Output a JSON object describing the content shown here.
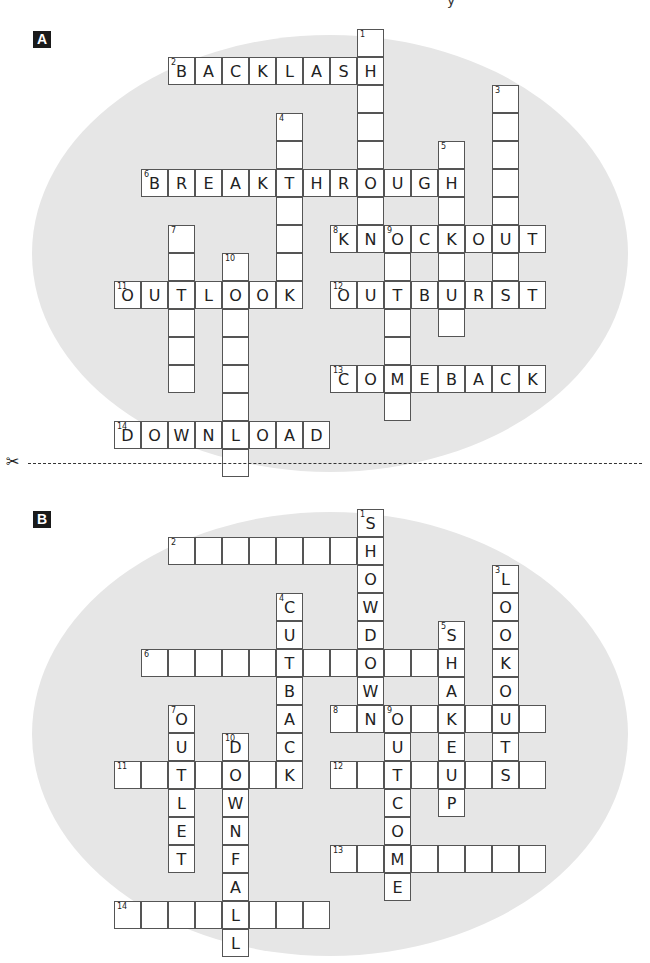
{
  "page": {
    "top_fragment": "y",
    "scissors_icon": "✂",
    "cell_size": {
      "w": 27,
      "h": 28
    },
    "origin_x": 114,
    "colors": {
      "ellipse": "#e6e6e6",
      "cell_border": "#555555",
      "label_bg": "#1a1a1a"
    }
  },
  "puzzles": [
    {
      "id": "A",
      "label": "A",
      "label_pos": {
        "x": 33,
        "y": 31
      },
      "origin_y": 29,
      "ellipse": {
        "left": 32,
        "top": 35,
        "width": 596,
        "height": 437
      },
      "words": [
        {
          "num": "1",
          "dir": "down",
          "row": 0,
          "col": 9,
          "len": 8,
          "answer": ""
        },
        {
          "num": "2",
          "dir": "across",
          "row": 1,
          "col": 2,
          "len": 8,
          "answer": "BACKLASH"
        },
        {
          "num": "3",
          "dir": "down",
          "row": 2,
          "col": 14,
          "len": 8,
          "answer": ""
        },
        {
          "num": "4",
          "dir": "down",
          "row": 3,
          "col": 6,
          "len": 7,
          "answer": ""
        },
        {
          "num": "5",
          "dir": "down",
          "row": 4,
          "col": 12,
          "len": 7,
          "answer": ""
        },
        {
          "num": "6",
          "dir": "across",
          "row": 5,
          "col": 1,
          "len": 12,
          "answer": "BREAKTHROUGH"
        },
        {
          "num": "7",
          "dir": "down",
          "row": 7,
          "col": 2,
          "len": 6,
          "answer": ""
        },
        {
          "num": "8",
          "dir": "across",
          "row": 7,
          "col": 8,
          "len": 8,
          "answer": "KNOCKOUT"
        },
        {
          "num": "9",
          "dir": "down",
          "row": 7,
          "col": 10,
          "len": 7,
          "answer": ""
        },
        {
          "num": "10",
          "dir": "down",
          "row": 8,
          "col": 4,
          "len": 8,
          "answer": ""
        },
        {
          "num": "11",
          "dir": "across",
          "row": 9,
          "col": 0,
          "len": 7,
          "answer": "OUTLOOK"
        },
        {
          "num": "12",
          "dir": "across",
          "row": 9,
          "col": 8,
          "len": 8,
          "answer": "OUTBURST"
        },
        {
          "num": "13",
          "dir": "across",
          "row": 12,
          "col": 8,
          "len": 8,
          "answer": "COMEBACK"
        },
        {
          "num": "14",
          "dir": "across",
          "row": 14,
          "col": 0,
          "len": 8,
          "answer": "DOWNLOAD"
        }
      ]
    },
    {
      "id": "B",
      "label": "B",
      "label_pos": {
        "x": 33,
        "y": 511
      },
      "origin_y": 509,
      "ellipse": {
        "left": 32,
        "top": 512,
        "width": 596,
        "height": 444
      },
      "words": [
        {
          "num": "1",
          "dir": "down",
          "row": 0,
          "col": 9,
          "len": 8,
          "answer": "SHOWDOWN"
        },
        {
          "num": "2",
          "dir": "across",
          "row": 1,
          "col": 2,
          "len": 8,
          "answer": ""
        },
        {
          "num": "3",
          "dir": "down",
          "row": 2,
          "col": 14,
          "len": 8,
          "answer": "LOOKOUTS"
        },
        {
          "num": "4",
          "dir": "down",
          "row": 3,
          "col": 6,
          "len": 7,
          "answer": "CUTBACK"
        },
        {
          "num": "5",
          "dir": "down",
          "row": 4,
          "col": 12,
          "len": 7,
          "answer": "SHAKEUP"
        },
        {
          "num": "6",
          "dir": "across",
          "row": 5,
          "col": 1,
          "len": 12,
          "answer": ""
        },
        {
          "num": "7",
          "dir": "down",
          "row": 7,
          "col": 2,
          "len": 6,
          "answer": "OUTLET"
        },
        {
          "num": "8",
          "dir": "across",
          "row": 7,
          "col": 8,
          "len": 8,
          "answer": ""
        },
        {
          "num": "9",
          "dir": "down",
          "row": 7,
          "col": 10,
          "len": 7,
          "answer": "OUTCOME"
        },
        {
          "num": "10",
          "dir": "down",
          "row": 8,
          "col": 4,
          "len": 8,
          "answer": "DOWNFALL"
        },
        {
          "num": "11",
          "dir": "across",
          "row": 9,
          "col": 0,
          "len": 7,
          "answer": ""
        },
        {
          "num": "12",
          "dir": "across",
          "row": 9,
          "col": 8,
          "len": 8,
          "answer": ""
        },
        {
          "num": "13",
          "dir": "across",
          "row": 12,
          "col": 8,
          "len": 8,
          "answer": ""
        },
        {
          "num": "14",
          "dir": "across",
          "row": 14,
          "col": 0,
          "len": 8,
          "answer": ""
        }
      ]
    }
  ]
}
